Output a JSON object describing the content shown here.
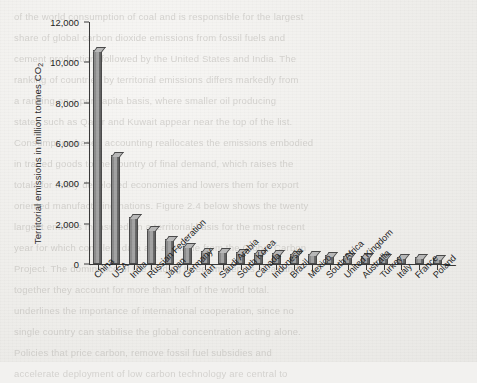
{
  "chart_data": {
    "type": "bar",
    "title": "",
    "xlabel": "",
    "ylabel": "Territorial emissions in million tonnes CO₂",
    "ylim": [
      0,
      12000
    ],
    "yticks": [
      0,
      2000,
      4000,
      6000,
      8000,
      10000,
      12000
    ],
    "ytick_labels": [
      "0",
      "2,000",
      "4,000",
      "6,000",
      "8,000",
      "10,000",
      "12,000"
    ],
    "grid": false,
    "legend": "none",
    "categories": [
      "China",
      "USA",
      "India",
      "Russian Federation",
      "Japan",
      "Germany",
      "Iran",
      "Saudi Arabia",
      "South Korea",
      "Canada",
      "Indonesia",
      "Brazil",
      "Mexico",
      "South Africa",
      "United Kingdom",
      "Australia",
      "Turkey",
      "Italy",
      "France",
      "Poland"
    ],
    "values": [
      10600,
      5400,
      2350,
      1750,
      1250,
      900,
      640,
      620,
      610,
      560,
      530,
      510,
      490,
      470,
      400,
      390,
      360,
      340,
      330,
      310
    ]
  },
  "axis": {
    "y_title": "Territorial emissions in million tonnes CO",
    "y_title_sub": "2"
  },
  "background_text": {
    "lines": [
      "of the world consumption of coal and is responsible for the largest",
      "share of global carbon dioxide emissions from fossil fuels and",
      "cement production, followed by the United States and India. The",
      "ranking of countries by territorial emissions differs markedly from",
      "a ranking on a per capita basis, where smaller oil producing",
      "states such as Qatar and Kuwait appear near the top of the list.",
      "Consumption based accounting reallocates the emissions embodied",
      "in traded goods to the country of final demand, which raises the",
      "totals for many developed economies and lowers them for export",
      "oriented manufacturing nations. Figure 2.4 below shows the twenty",
      "largest emitters measured on a territorial basis for the most recent",
      "year for which complete data are available from the Global Carbon",
      "Project. The dominance of the leading three emitters is clear and",
      "together they account for more than half of the world total."
    ],
    "bottom_lines": [
      "underlines the importance of international cooperation, since no",
      "single country can stabilise the global concentration acting alone.",
      "Policies that price carbon, remove fossil fuel subsidies and",
      "accelerate deployment of low carbon technology are central to"
    ]
  }
}
